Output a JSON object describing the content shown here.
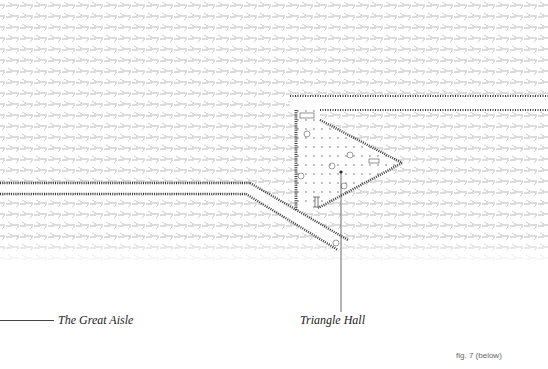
{
  "figure": {
    "caption": "fig. 7 (below)",
    "labels": {
      "great_aisle": "The Great Aisle",
      "triangle_hall": "Triangle Hall"
    }
  },
  "colors": {
    "background": "#ffffff",
    "hatch": "#8a8a8a",
    "hatch_dark": "#3a3a3a",
    "leader": "#444444",
    "text": "#222222",
    "caption": "#666666"
  }
}
